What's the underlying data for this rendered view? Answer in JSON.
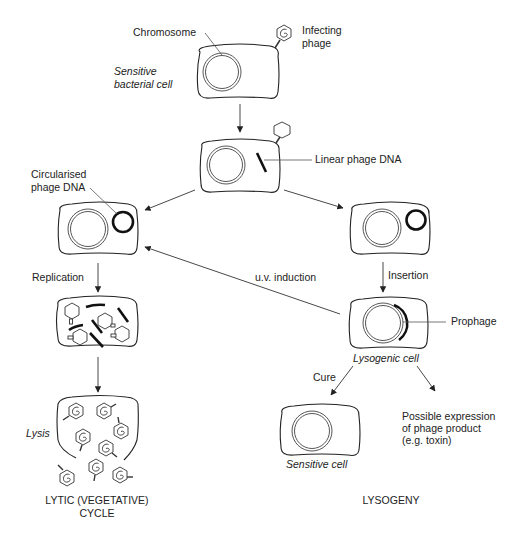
{
  "labels": {
    "chromosome": "Chromosome",
    "infecting_phage_1": "Infecting",
    "infecting_phage_2": "phage",
    "sensitive_bacterial_cell_1": "Sensitive",
    "sensitive_bacterial_cell_2": "bacterial cell",
    "linear_phage_dna": "Linear phage DNA",
    "circularised_1": "Circularised",
    "circularised_2": "phage DNA",
    "replication": "Replication",
    "uv_induction": "u.v. induction",
    "insertion": "Insertion",
    "prophage": "Prophage",
    "lysogenic_cell": "Lysogenic cell",
    "cure": "Cure",
    "lysis": "Lysis",
    "sensitive_cell": "Sensitive cell",
    "possible_expression_1": "Possible expression",
    "possible_expression_2": "of phage product",
    "possible_expression_3": "(e.g. toxin)",
    "lytic_1": "LYTIC (VEGETATIVE)",
    "lytic_2": "CYCLE",
    "lysogeny": "LYSOGENY"
  },
  "colors": {
    "stroke": "#222222",
    "background": "#ffffff"
  }
}
